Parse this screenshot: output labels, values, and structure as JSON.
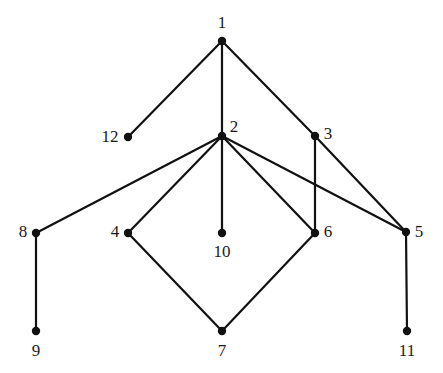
{
  "figure": {
    "type": "undirected-graph-diagram",
    "background_color": "#ffffff",
    "edge_color": "#111111",
    "node_color": "#111111",
    "label_color": "#1a1a1a",
    "edge_width": 2.2,
    "node_radius": 4.2,
    "width": 443,
    "height": 373
  },
  "nodes": [
    {
      "id": "1",
      "label": "1",
      "x": 222,
      "y": 41,
      "label_x": 222,
      "label_y": 22
    },
    {
      "id": "2",
      "label": "2",
      "x": 222,
      "y": 136,
      "label_x": 234,
      "label_y": 126
    },
    {
      "id": "3",
      "label": "3",
      "x": 315,
      "y": 136,
      "label_x": 328,
      "label_y": 133
    },
    {
      "id": "4",
      "label": "4",
      "x": 128,
      "y": 233,
      "label_x": 115,
      "label_y": 231
    },
    {
      "id": "5",
      "label": "5",
      "x": 406,
      "y": 232,
      "label_x": 419,
      "label_y": 231
    },
    {
      "id": "6",
      "label": "6",
      "x": 315,
      "y": 233,
      "label_x": 328,
      "label_y": 231
    },
    {
      "id": "7",
      "label": "7",
      "x": 222,
      "y": 331,
      "label_x": 222,
      "label_y": 350
    },
    {
      "id": "8",
      "label": "8",
      "x": 36,
      "y": 233,
      "label_x": 23,
      "label_y": 231
    },
    {
      "id": "9",
      "label": "9",
      "x": 36,
      "y": 331,
      "label_x": 36,
      "label_y": 350
    },
    {
      "id": "10",
      "label": "10",
      "x": 222,
      "y": 233,
      "label_x": 222,
      "label_y": 251
    },
    {
      "id": "11",
      "label": "11",
      "x": 407,
      "y": 331,
      "label_x": 407,
      "label_y": 350
    },
    {
      "id": "12",
      "label": "12",
      "x": 128,
      "y": 137,
      "label_x": 110,
      "label_y": 136
    }
  ],
  "edges": [
    {
      "source": "1",
      "target": "12"
    },
    {
      "source": "1",
      "target": "2"
    },
    {
      "source": "1",
      "target": "3"
    },
    {
      "source": "2",
      "target": "8"
    },
    {
      "source": "2",
      "target": "4"
    },
    {
      "source": "2",
      "target": "10"
    },
    {
      "source": "2",
      "target": "6"
    },
    {
      "source": "2",
      "target": "5"
    },
    {
      "source": "3",
      "target": "6"
    },
    {
      "source": "3",
      "target": "5"
    },
    {
      "source": "4",
      "target": "7"
    },
    {
      "source": "6",
      "target": "7"
    },
    {
      "source": "8",
      "target": "9"
    },
    {
      "source": "5",
      "target": "11"
    }
  ]
}
